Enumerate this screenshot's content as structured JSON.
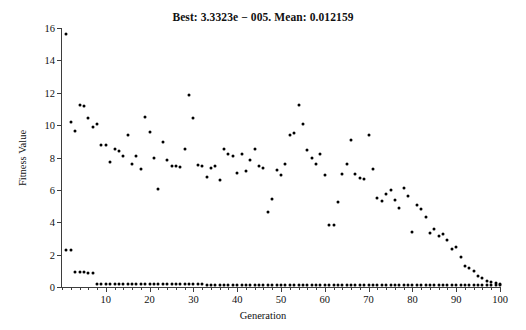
{
  "chart_data": {
    "type": "scatter",
    "title": "Best: 3.3323e − 005. Mean: 0.012159",
    "xlabel": "Generation",
    "ylabel": "Fitness Value",
    "xlim": [
      0,
      100
    ],
    "ylim": [
      0,
      16
    ],
    "xticks": [
      10,
      20,
      30,
      40,
      50,
      60,
      70,
      80,
      90,
      100
    ],
    "yticks": [
      0,
      2,
      4,
      6,
      8,
      10,
      12,
      14,
      16
    ],
    "grid": false,
    "legend": null,
    "best_value": "3.3323e − 005",
    "mean_value": "0.012159",
    "series": [
      {
        "name": "Mean fitness",
        "marker": "dot",
        "color": "#000000",
        "x": [
          1,
          2,
          3,
          4,
          5,
          6,
          7,
          8,
          9,
          10,
          11,
          12,
          13,
          14,
          15,
          16,
          17,
          18,
          19,
          20,
          21,
          22,
          23,
          24,
          25,
          26,
          27,
          28,
          29,
          30,
          31,
          32,
          33,
          34,
          35,
          36,
          37,
          38,
          39,
          40,
          41,
          42,
          43,
          44,
          45,
          46,
          47,
          48,
          49,
          50,
          51,
          52,
          53,
          54,
          55,
          56,
          57,
          58,
          59,
          60,
          61,
          62,
          63,
          64,
          65,
          66,
          67,
          68,
          69,
          70,
          71,
          72,
          73,
          74,
          75,
          76,
          77,
          78,
          79,
          80,
          81,
          82,
          83,
          84,
          85,
          86,
          87,
          88,
          89,
          90,
          91,
          92,
          93,
          94,
          95,
          96,
          97,
          98,
          99,
          100
        ],
        "y": [
          15.6,
          10.2,
          9.65,
          11.25,
          11.2,
          10.45,
          9.9,
          10.1,
          8.8,
          8.75,
          7.75,
          8.5,
          8.4,
          8.1,
          9.4,
          7.6,
          8.1,
          7.3,
          10.5,
          9.6,
          7.95,
          6.05,
          8.95,
          7.85,
          7.5,
          7.5,
          7.4,
          8.5,
          11.85,
          10.45,
          7.55,
          7.5,
          6.8,
          7.35,
          7.5,
          6.6,
          8.5,
          8.2,
          8.1,
          7.05,
          8.2,
          7.15,
          7.85,
          8.5,
          7.5,
          7.35,
          4.65,
          5.45,
          7.2,
          6.9,
          7.6,
          9.4,
          9.5,
          11.25,
          10.1,
          8.45,
          8.0,
          7.6,
          8.2,
          6.9,
          3.85,
          3.8,
          5.25,
          6.95,
          7.6,
          9.1,
          7.0,
          6.75,
          6.65,
          9.4,
          7.3,
          5.5,
          5.3,
          5.75,
          6.0,
          5.35,
          4.9,
          6.1,
          5.6,
          3.4,
          5.05,
          4.8,
          4.35,
          3.35,
          3.6,
          3.15,
          3.3,
          2.9,
          2.35,
          2.5,
          1.85,
          1.3,
          1.2,
          1.0,
          0.7,
          0.55,
          0.35,
          0.3,
          0.25,
          0.2
        ]
      },
      {
        "name": "Best fitness",
        "marker": "dot",
        "color": "#000000",
        "x": [
          1,
          2,
          3,
          4,
          5,
          6,
          7,
          8,
          9,
          10,
          11,
          12,
          13,
          14,
          15,
          16,
          17,
          18,
          19,
          20,
          21,
          22,
          23,
          24,
          25,
          26,
          27,
          28,
          29,
          30,
          31,
          32,
          33,
          34,
          35,
          36,
          37,
          38,
          39,
          40,
          41,
          42,
          43,
          44,
          45,
          46,
          47,
          48,
          49,
          50,
          51,
          52,
          53,
          54,
          55,
          56,
          57,
          58,
          59,
          60,
          61,
          62,
          63,
          64,
          65,
          66,
          67,
          68,
          69,
          70,
          71,
          72,
          73,
          74,
          75,
          76,
          77,
          78,
          79,
          80,
          81,
          82,
          83,
          84,
          85,
          86,
          87,
          88,
          89,
          90,
          91,
          92,
          93,
          94,
          95,
          96,
          97,
          98,
          99,
          100
        ],
        "y": [
          2.3,
          2.3,
          0.95,
          0.95,
          0.95,
          0.85,
          0.85,
          0.2,
          0.2,
          0.2,
          0.2,
          0.2,
          0.2,
          0.2,
          0.2,
          0.2,
          0.2,
          0.2,
          0.2,
          0.2,
          0.2,
          0.2,
          0.2,
          0.2,
          0.2,
          0.2,
          0.2,
          0.2,
          0.2,
          0.2,
          0.2,
          0.2,
          0.1,
          0.1,
          0.1,
          0.1,
          0.1,
          0.1,
          0.1,
          0.1,
          0.1,
          0.1,
          0.1,
          0.1,
          0.1,
          0.1,
          0.1,
          0.1,
          0.1,
          0.1,
          0.1,
          0.1,
          0.1,
          0.1,
          0.1,
          0.1,
          0.1,
          0.1,
          0.1,
          0.1,
          0.1,
          0.1,
          0.1,
          0.1,
          0.1,
          0.1,
          0.1,
          0.1,
          0.1,
          0.1,
          0.1,
          0.1,
          0.1,
          0.1,
          0.1,
          0.1,
          0.1,
          0.1,
          0.1,
          0.1,
          0.1,
          0.1,
          0.1,
          0.1,
          0.1,
          0.1,
          0.1,
          0.1,
          0.1,
          0.1,
          0.1,
          0.1,
          0.1,
          0.1,
          0.1,
          0.1,
          0.1,
          0.1,
          0.1,
          0.1
        ]
      }
    ]
  }
}
